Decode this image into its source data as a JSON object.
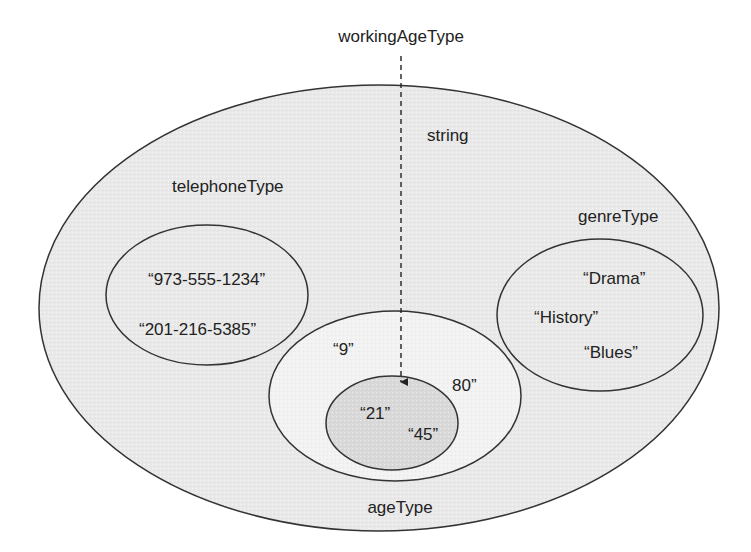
{
  "diagram": {
    "title_label": "workingAgeType",
    "colors": {
      "outer_fill": "#e9e9e9",
      "age_fill": "#f3f3f3",
      "working_age_fill": "#dadada",
      "group_fill": "#ececec",
      "stroke": "#333333",
      "text": "#222222"
    },
    "sets": {
      "string": {
        "label": "string"
      },
      "telephoneType": {
        "label": "telephoneType",
        "values": [
          "“973-555-1234”",
          "“201-216-5385”"
        ]
      },
      "genreType": {
        "label": "genreType",
        "values": [
          "“Drama”",
          "“History”",
          "“Blues”"
        ]
      },
      "ageType": {
        "label": "ageType",
        "values": [
          "“9”",
          "80”"
        ]
      },
      "workingAgeType": {
        "label": "workingAgeType",
        "values": [
          "“21”",
          "“45”"
        ]
      }
    }
  }
}
